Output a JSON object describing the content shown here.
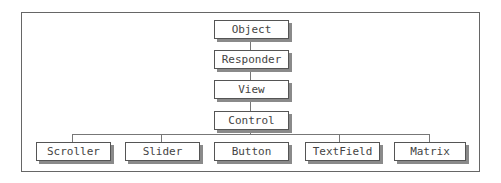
{
  "diagram": {
    "type": "class-hierarchy",
    "chain": [
      "Object",
      "Responder",
      "View",
      "Control"
    ],
    "children": [
      "Scroller",
      "Slider",
      "Button",
      "TextField",
      "Matrix"
    ],
    "edges": [
      [
        "Object",
        "Responder"
      ],
      [
        "Responder",
        "View"
      ],
      [
        "View",
        "Control"
      ],
      [
        "Control",
        "Scroller"
      ],
      [
        "Control",
        "Slider"
      ],
      [
        "Control",
        "Button"
      ],
      [
        "Control",
        "TextField"
      ],
      [
        "Control",
        "Matrix"
      ]
    ]
  },
  "nodes": {
    "object": "Object",
    "responder": "Responder",
    "view": "View",
    "control": "Control",
    "scroller": "Scroller",
    "slider": "Slider",
    "button": "Button",
    "textfield": "TextField",
    "matrix": "Matrix"
  }
}
